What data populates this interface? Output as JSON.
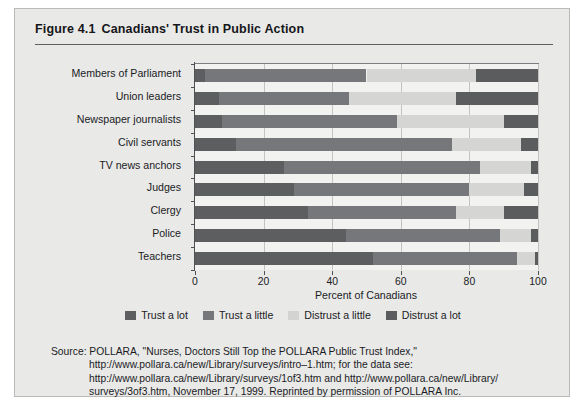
{
  "figure": {
    "number": "Figure 4.1",
    "title": "Canadians' Trust in Public Action"
  },
  "chart_data": {
    "type": "bar",
    "orientation": "horizontal",
    "stacked": true,
    "stack_mode": "percent",
    "title": "Canadians' Trust in Public Action",
    "xlabel": "Percent of Canadians",
    "ylabel": "",
    "xlim": [
      0,
      100
    ],
    "xticks": [
      0,
      20,
      40,
      60,
      80,
      100
    ],
    "xticklabels": [
      "0",
      "20",
      "40",
      "60",
      "80",
      "100"
    ],
    "grid": "vertical",
    "legend_position": "bottom",
    "categories": [
      "Members of Parliament",
      "Union leaders",
      "Newspaper journalists",
      "Civil servants",
      "TV news anchors",
      "Judges",
      "Clergy",
      "Police",
      "Teachers"
    ],
    "series": [
      {
        "name": "Trust a lot",
        "color": "#5c5e60",
        "values": [
          3,
          7,
          8,
          12,
          26,
          29,
          33,
          44,
          52
        ]
      },
      {
        "name": "Trust a little",
        "color": "#75777a",
        "values": [
          47,
          38,
          51,
          63,
          57,
          51,
          43,
          45,
          42
        ]
      },
      {
        "name": "Distrust a little",
        "color": "#d5d6d4",
        "values": [
          32,
          31,
          31,
          20,
          15,
          16,
          14,
          9,
          5
        ]
      },
      {
        "name": "Distrust a lot",
        "color": "#5a5c5e",
        "values": [
          18,
          24,
          10,
          5,
          2,
          4,
          10,
          2,
          1
        ]
      }
    ]
  },
  "source": {
    "label": "Source:",
    "lines": [
      "POLLARA, \"Nurses, Doctors Still Top the POLLARA Public Trust Index,\"",
      "http://www.pollara.ca/new/Library/surveys/intro–1.htm; for the data see:",
      "http://www.pollara.ca/new/Library/surveys/1of3.htm and http://www.pollara.ca/new/Library/",
      "surveys/3of3.htm, November 17, 1999. Reprinted by permission of POLLARA Inc."
    ]
  }
}
